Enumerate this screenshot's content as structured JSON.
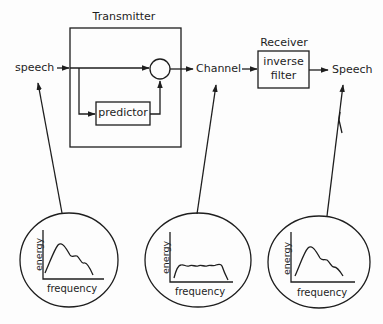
{
  "diagram": {
    "transmitter": {
      "title": "Transmitter",
      "input_label": "speech",
      "predictor_label": "predictor",
      "summing_node": "subtract-circle"
    },
    "channel": {
      "label": "Channel"
    },
    "receiver": {
      "title": "Receiver",
      "filter_label_line1": "inverse",
      "filter_label_line2": "filter",
      "output_label": "Speech"
    },
    "spectra": [
      {
        "id": "input-speech-spectrum",
        "points_to": "speech",
        "y_label": "energy",
        "x_label": "frequency",
        "shape": "peaked-decaying"
      },
      {
        "id": "channel-spectrum",
        "points_to": "Channel",
        "y_label": "energy",
        "x_label": "frequency",
        "shape": "flat-whitened"
      },
      {
        "id": "output-speech-spectrum",
        "points_to": "Speech",
        "y_label": "energy",
        "x_label": "frequency",
        "shape": "peaked-decaying"
      }
    ],
    "colors": {
      "stroke": "#1e1e1e",
      "background": "#fdfdfd"
    }
  }
}
